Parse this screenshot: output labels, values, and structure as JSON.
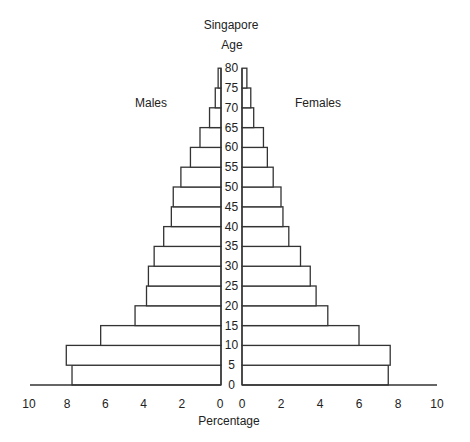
{
  "chart_data": {
    "type": "bar",
    "subtype": "population-pyramid",
    "title": "Singapore",
    "ylabel": "Age",
    "xlabel": "Percentage",
    "left_label": "Males",
    "right_label": "Females",
    "age_ticks": [
      "0",
      "5",
      "10",
      "15",
      "20",
      "25",
      "30",
      "35",
      "40",
      "45",
      "50",
      "55",
      "60",
      "65",
      "70",
      "75",
      "80"
    ],
    "x_ticks_left": [
      "10",
      "8",
      "6",
      "4",
      "2",
      "0"
    ],
    "x_ticks_right": [
      "0",
      "2",
      "4",
      "6",
      "8",
      "10"
    ],
    "xlim": [
      0,
      10
    ],
    "grid": false,
    "categories": [
      "0-4",
      "5-9",
      "10-14",
      "15-19",
      "20-24",
      "25-29",
      "30-34",
      "35-39",
      "40-44",
      "45-49",
      "50-54",
      "55-59",
      "60-64",
      "65-69",
      "70-74",
      "75-79"
    ],
    "series": [
      {
        "name": "Males",
        "values": [
          7.8,
          8.1,
          6.3,
          4.5,
          3.9,
          3.8,
          3.5,
          3.0,
          2.6,
          2.5,
          2.1,
          1.6,
          1.1,
          0.6,
          0.3,
          0.15
        ]
      },
      {
        "name": "Females",
        "values": [
          7.5,
          7.6,
          6.0,
          4.4,
          3.8,
          3.5,
          3.0,
          2.4,
          2.1,
          2.0,
          1.6,
          1.3,
          1.1,
          0.6,
          0.45,
          0.25
        ]
      }
    ],
    "colors": {
      "stroke": "#333333",
      "fill": "#ffffff",
      "text": "#222222"
    }
  }
}
